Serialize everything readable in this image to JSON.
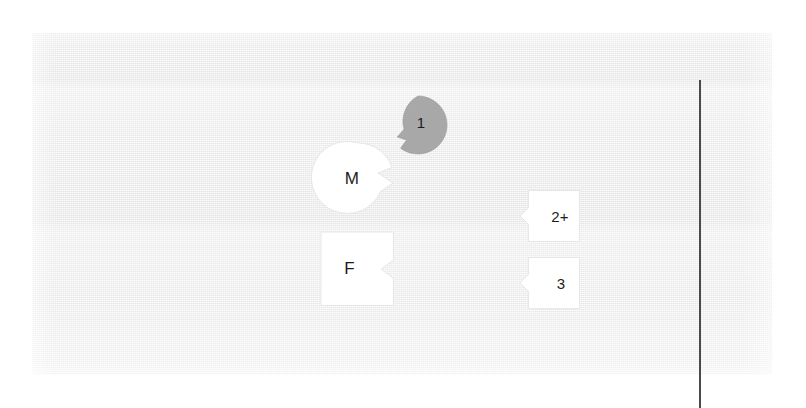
{
  "diagram": {
    "panel": {
      "background_color": "#ededed",
      "page_color": "#ffffff"
    },
    "divider": {
      "name": "vertical-rule",
      "color": "#4a4a4a",
      "orientation": "vertical"
    },
    "nodes": [
      {
        "id": "1",
        "label": "1",
        "shape": "circle-notched",
        "fill": "#a8a8a8",
        "notch_side": "bottom-left"
      },
      {
        "id": "M",
        "label": "M",
        "shape": "circle-notched",
        "fill": "#ffffff",
        "notch_side": "right"
      },
      {
        "id": "F",
        "label": "F",
        "shape": "square-notched",
        "fill": "#ffffff",
        "notch_side": "right"
      },
      {
        "id": "2plus",
        "label": "2+",
        "shape": "square-notched",
        "fill": "#ffffff",
        "notch_side": "left"
      },
      {
        "id": "3",
        "label": "3",
        "shape": "square-notched",
        "fill": "#ffffff",
        "notch_side": "left"
      }
    ]
  }
}
